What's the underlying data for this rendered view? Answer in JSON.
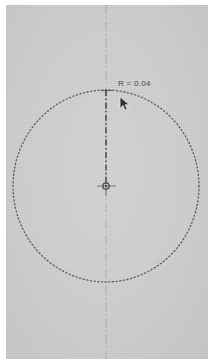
{
  "canvas": {
    "background_color": "#cdcdcd",
    "page_border_color": "#ffffff",
    "width": 212,
    "height": 362
  },
  "drawing": {
    "title": "circle-with-radius-dimension",
    "geometry_color": "#4a4a4a",
    "centerline_color": "#8c8c8c",
    "dimension_color": "#3a3a3a",
    "circle": {
      "name": "dotted-circle",
      "style": "dotted",
      "center_x": 106,
      "center_y": 186,
      "radius_x": 93,
      "radius_y": 96
    },
    "center_mark": {
      "name": "center-mark",
      "x": 106,
      "y": 186
    },
    "vertical_centerline": {
      "name": "vertical-centerline",
      "style": "dash-dot",
      "x": 106,
      "y_start": 0,
      "y_end": 362
    },
    "radius_dimension_line": {
      "name": "radius-dimension-line",
      "style": "dash-dot",
      "x": 106,
      "y_start": 90,
      "y_end": 186
    }
  },
  "labels": {
    "radius_dimension": "R = 0.04"
  },
  "cursor": {
    "icon": "mouse-pointer-arrow",
    "x": 119,
    "y": 96
  }
}
